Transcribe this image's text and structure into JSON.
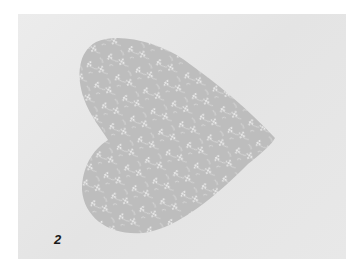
{
  "figure": {
    "label": "2",
    "colors": {
      "background": "#e6e6e6",
      "heart_fabric": "#bdbdbd",
      "floral_print": "#f2f2f2",
      "label_text": "#1a1a1a"
    }
  }
}
